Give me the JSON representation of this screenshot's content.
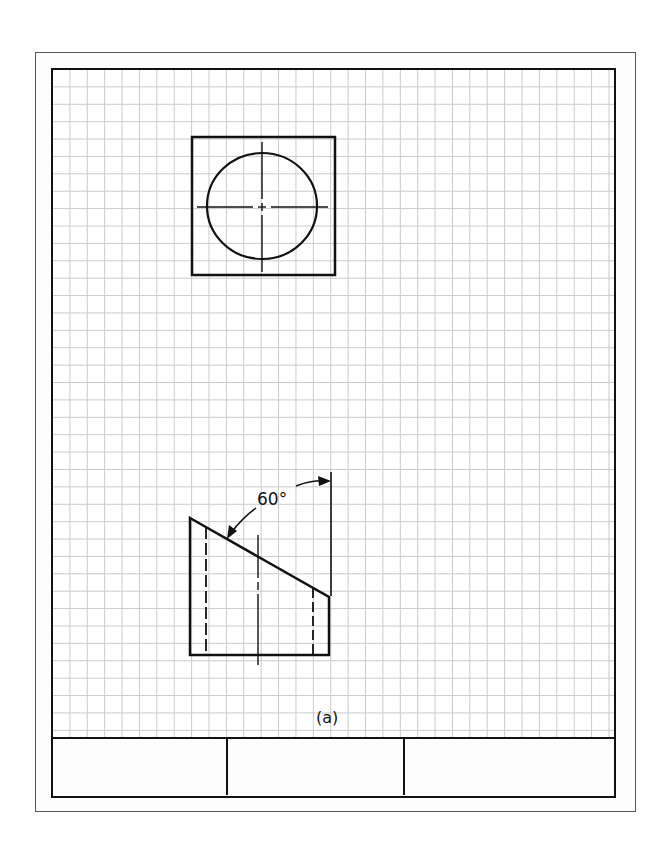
{
  "figure": {
    "caption": "(a)",
    "angle_label": "60°",
    "sheet": {
      "grid": "square grid paper",
      "title_block_cells": [
        "",
        "",
        ""
      ]
    },
    "views": {
      "top_view": {
        "shape": "square with circle",
        "features": [
          "square outline",
          "circle",
          "horizontal center line",
          "vertical center line"
        ]
      },
      "front_view": {
        "shape": "truncated block with 60° inclined top face",
        "features": [
          "outline",
          "left hidden line",
          "right hidden line",
          "center line",
          "vertical reference line",
          "60° angle dimension"
        ]
      }
    }
  },
  "colors": {
    "line": "#111111",
    "grid": "#c9c9c9",
    "paper": "#ffffff"
  }
}
